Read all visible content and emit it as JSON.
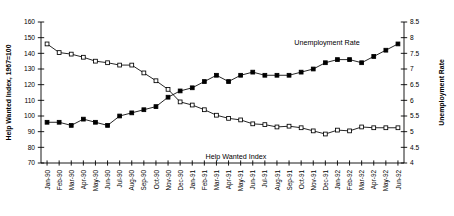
{
  "chart_data": {
    "type": "line",
    "title": "",
    "xlabel": "",
    "ylabel": "Help Wanted Index, 1967=100",
    "y2label": "Unemployment Rate",
    "grid": false,
    "legend": "inline-annotations",
    "ylim": [
      70,
      160
    ],
    "y2lim": [
      4,
      8.5
    ],
    "yticks": [
      70,
      80,
      90,
      100,
      110,
      120,
      130,
      140,
      150,
      160
    ],
    "y2ticks": [
      4,
      4.5,
      5,
      5.5,
      6,
      6.5,
      7,
      7.5,
      8,
      8.5
    ],
    "categories": [
      "Jan-90",
      "Feb-90",
      "Mar-90",
      "Apr-90",
      "May-90",
      "Jun-90",
      "Jul-90",
      "Aug-90",
      "Sep-90",
      "Oct-90",
      "Nov-90",
      "Dec-90",
      "Jan-91",
      "Feb-91",
      "Mar-91",
      "Apr-91",
      "May-91",
      "Jun-91",
      "Jul-91",
      "Aug-91",
      "Sep-91",
      "Oct-91",
      "Nov-91",
      "Dec-91",
      "Jan-92",
      "Feb-92",
      "Mar-92",
      "Apr-92",
      "May-92",
      "Jun-92"
    ],
    "series": [
      {
        "name": "Help Wanted Index",
        "axis": "left",
        "marker": "open-square",
        "values": [
          146.0,
          140.5,
          139.5,
          137.5,
          135.0,
          134.0,
          132.5,
          132.5,
          127.5,
          122.5,
          117.0,
          109.0,
          107.0,
          104.0,
          100.5,
          98.5,
          97.5,
          95.0,
          94.5,
          93.0,
          93.5,
          92.5,
          90.5,
          88.5,
          91.0,
          90.5,
          93.0,
          92.5,
          92.5,
          92.5
        ]
      },
      {
        "name": "Unemployment Rate",
        "axis": "right",
        "marker": "filled-square",
        "values": [
          5.3,
          5.3,
          5.2,
          5.4,
          5.3,
          5.2,
          5.5,
          5.6,
          5.7,
          5.8,
          6.1,
          6.3,
          6.4,
          6.6,
          6.8,
          6.6,
          6.8,
          6.9,
          6.8,
          6.8,
          6.8,
          6.9,
          7.0,
          7.2,
          7.3,
          7.3,
          7.2,
          7.4,
          7.6,
          7.8
        ]
      }
    ],
    "annotations": [
      {
        "text": "Unemployment Rate",
        "x_category": "Feb-92",
        "series": "Unemployment Rate"
      },
      {
        "text": "Help Wanted Index",
        "x_category": "Jun-91",
        "series": "Help Wanted Index"
      }
    ]
  }
}
